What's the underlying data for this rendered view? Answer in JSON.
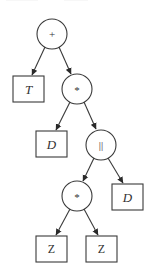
{
  "diagram": {
    "type": "expression-tree",
    "stroke_color": "#3a3a3a",
    "nodes": [
      {
        "id": "n1",
        "shape": "circle",
        "label": "+",
        "cx": 52,
        "cy": 34,
        "r": 15
      },
      {
        "id": "n2",
        "shape": "box",
        "label": "T",
        "x": 13,
        "y": 76,
        "w": 31,
        "h": 26
      },
      {
        "id": "n3",
        "shape": "circle",
        "label": "*",
        "cx": 77,
        "cy": 89,
        "r": 15
      },
      {
        "id": "n4",
        "shape": "box",
        "label": "D",
        "x": 36,
        "y": 131,
        "w": 31,
        "h": 26
      },
      {
        "id": "n5",
        "shape": "circle",
        "label": "||",
        "cx": 101,
        "cy": 145,
        "r": 15
      },
      {
        "id": "n6",
        "shape": "circle",
        "label": "*",
        "cx": 77,
        "cy": 196,
        "r": 15
      },
      {
        "id": "n7",
        "shape": "box",
        "label": "D",
        "x": 112,
        "y": 184,
        "w": 31,
        "h": 26
      },
      {
        "id": "n8",
        "shape": "box",
        "label": "Z",
        "x": 36,
        "y": 236,
        "w": 31,
        "h": 26
      },
      {
        "id": "n9",
        "shape": "box",
        "label": "Z",
        "x": 86,
        "y": 236,
        "w": 31,
        "h": 26
      }
    ],
    "edges": [
      {
        "from": "n1",
        "to": "n2"
      },
      {
        "from": "n1",
        "to": "n3"
      },
      {
        "from": "n3",
        "to": "n4"
      },
      {
        "from": "n3",
        "to": "n5"
      },
      {
        "from": "n5",
        "to": "n6"
      },
      {
        "from": "n5",
        "to": "n7"
      },
      {
        "from": "n6",
        "to": "n8"
      },
      {
        "from": "n6",
        "to": "n9"
      }
    ],
    "labels": {
      "root_op": "+",
      "leaf_t": "T",
      "mid_op": "*",
      "leaf_d_left": "D",
      "parallel_op": "||",
      "lower_op": "*",
      "leaf_d_right": "D",
      "leaf_z_left": "Z",
      "leaf_z_right": "Z"
    }
  }
}
